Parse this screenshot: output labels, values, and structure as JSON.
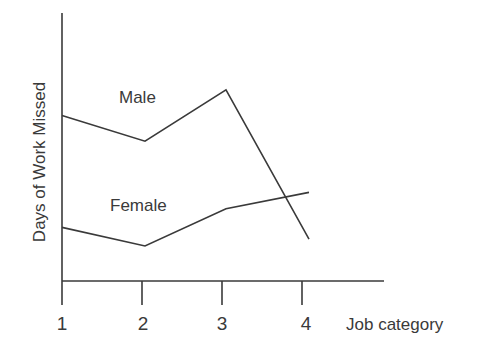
{
  "chart_data": {
    "type": "line",
    "title": "",
    "xlabel": "Job category",
    "ylabel": "Days of Work Missed",
    "categories": [
      "1",
      "2",
      "3",
      "4"
    ],
    "series": [
      {
        "name": "Male",
        "values": [
          7.1,
          6.0,
          8.2,
          1.8
        ]
      },
      {
        "name": "Female",
        "values": [
          2.3,
          1.5,
          3.1,
          3.8
        ]
      }
    ],
    "ylim": [
      0,
      11.5
    ],
    "yticks": [],
    "grid": false,
    "legend": "inline labels"
  },
  "colors": {
    "line": "#3a3a3a",
    "axis": "#3a3a3a",
    "text": "#3a3a3a"
  }
}
